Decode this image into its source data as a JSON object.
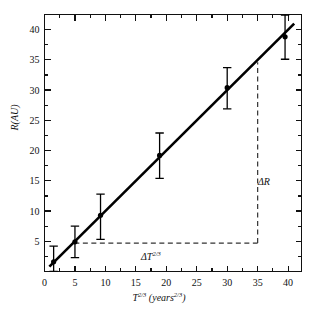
{
  "chart_data": {
    "type": "scatter",
    "title": "",
    "xlabel": "T^(2/3) (years^(2/3))",
    "ylabel": "R (AU)",
    "xlim": [
      0,
      42.2
    ],
    "ylim": [
      0,
      42.5
    ],
    "grid": false,
    "legend": null,
    "xticks": [
      0,
      5,
      10,
      15,
      20,
      25,
      30,
      35,
      40
    ],
    "yticks": [
      5,
      10,
      15,
      20,
      25,
      30,
      35,
      40
    ],
    "xtick_labels": [
      "0",
      "5",
      "10",
      "15",
      "20",
      "25",
      "30",
      "35",
      "40"
    ],
    "ytick_labels": [
      "5",
      "10",
      "15",
      "20",
      "25",
      "30",
      "35",
      "40"
    ],
    "minor_tick_step_x": 2.5,
    "minor_tick_step_y": 2.5,
    "x": [
      1.5,
      5.0,
      9.2,
      18.9,
      30.0,
      39.5
    ],
    "y": [
      1.6,
      4.9,
      9.3,
      19.2,
      30.4,
      38.8
    ],
    "yerr_low": [
      1.6,
      2.6,
      4.0,
      3.8,
      3.5,
      3.7
    ],
    "yerr_high": [
      2.6,
      2.6,
      3.5,
      3.7,
      3.3,
      3.6
    ],
    "series": [
      {
        "name": "measurements",
        "marker": "filled-circle",
        "values": [
          1.6,
          4.9,
          9.3,
          19.2,
          30.4,
          38.8
        ]
      },
      {
        "name": "best-fit-line",
        "type": "line",
        "slope": 1.0,
        "intercept": 0.0,
        "x_start": 0.8,
        "y_start": 0.8,
        "x_end": 41.0,
        "y_end": 41.0
      }
    ],
    "annotations": [
      {
        "name": "delta-R",
        "label": "ΔR",
        "x": 35.7,
        "y": 19.5,
        "guide": "vertical-dashed",
        "guide_x": 35.0,
        "guide_y_start": 4.7,
        "guide_y_end": 34.6
      },
      {
        "name": "delta-T",
        "label": "ΔT^(2/3)",
        "x": 20.0,
        "y": 2.6,
        "guide": "horizontal-dashed",
        "guide_y": 4.7,
        "guide_x_start": 4.9,
        "guide_x_end": 35.0
      }
    ],
    "colors": {
      "axis": "#111111",
      "data": "#000000",
      "fit_line": "#000000",
      "guide_line": "#333333",
      "background": "#ffffff"
    }
  },
  "labels": {
    "y_axis_text": "R (AU)",
    "y_axis_symbol": "R",
    "y_axis_unit": "(AU)",
    "x_axis_symbol": "T",
    "x_axis_exp": "2/3",
    "x_axis_unit_open": "(years",
    "x_axis_unit_exp": "2/3",
    "x_axis_unit_close": ")",
    "delta_r": "ΔR",
    "delta_t_symbol": "ΔT",
    "delta_t_exp": "2/3"
  }
}
